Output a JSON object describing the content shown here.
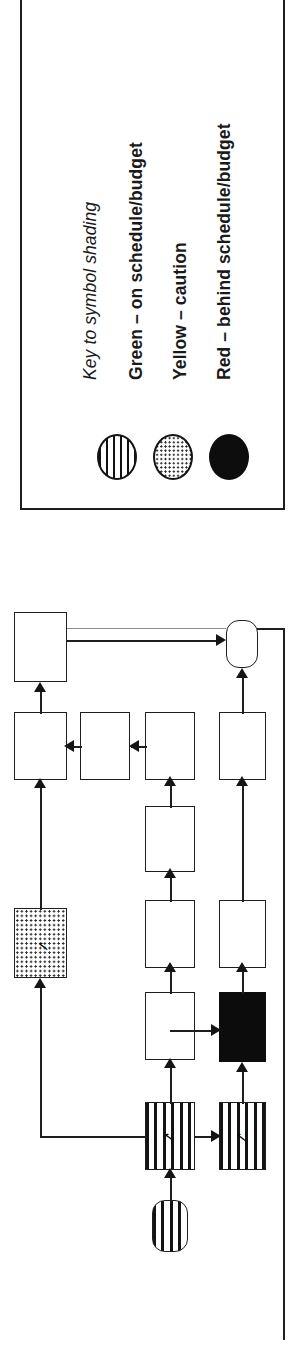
{
  "legend": {
    "title": "Key to symbol shading",
    "entries": [
      {
        "label": "Green – on schedule/budget",
        "swatch": "vertical-stripe-circle",
        "color": "#008000",
        "status": "on-schedule"
      },
      {
        "label": "Yellow – caution",
        "swatch": "stippled-circle",
        "color": "#FFD700",
        "status": "caution"
      },
      {
        "label": "Red – behind schedule/budget",
        "swatch": "solid-black-circle",
        "color": "#CC0000",
        "status": "behind-schedule"
      }
    ]
  },
  "flowchart": {
    "orientation": "rotated-90-ccw",
    "marker_glyph": "✓",
    "nodes": [
      {
        "id": "n-start",
        "label": "",
        "shape": "terminal",
        "shading": "green",
        "marker": ""
      },
      {
        "id": "n-a1",
        "label": "",
        "shape": "process",
        "shading": "green",
        "marker": "✓"
      },
      {
        "id": "n-a2",
        "label": "",
        "shape": "process",
        "shading": "green",
        "marker": "✓"
      },
      {
        "id": "n-red",
        "label": "",
        "shape": "process",
        "shading": "red",
        "marker": ""
      },
      {
        "id": "n-b1",
        "label": "",
        "shape": "process",
        "shading": "none",
        "marker": ""
      },
      {
        "id": "n-b2",
        "label": "",
        "shape": "process",
        "shading": "none",
        "marker": ""
      },
      {
        "id": "n-b3",
        "label": "",
        "shape": "process",
        "shading": "none",
        "marker": ""
      },
      {
        "id": "n-c1",
        "label": "",
        "shape": "process",
        "shading": "none",
        "marker": ""
      },
      {
        "id": "n-c2",
        "label": "",
        "shape": "process",
        "shading": "none",
        "marker": ""
      },
      {
        "id": "n-c3",
        "label": "",
        "shape": "process",
        "shading": "none",
        "marker": ""
      },
      {
        "id": "n-yellow",
        "label": "",
        "shape": "process",
        "shading": "yellow",
        "marker": "✓"
      },
      {
        "id": "n-top",
        "label": "",
        "shape": "process",
        "shading": "none",
        "marker": ""
      },
      {
        "id": "n-end",
        "label": "",
        "shape": "terminal",
        "shading": "none",
        "marker": ""
      }
    ],
    "edges": [
      {
        "from": "n-start",
        "to": "n-a1"
      },
      {
        "from": "n-a1",
        "to": "n-a2"
      },
      {
        "from": "n-a1",
        "to": "n-c1"
      },
      {
        "from": "n-a1",
        "to": "n-red"
      },
      {
        "from": "n-a1",
        "to": "n-yellow"
      },
      {
        "from": "n-a2",
        "to": "n-red"
      },
      {
        "from": "n-red",
        "to": "n-b1"
      },
      {
        "from": "n-b1",
        "to": "n-b2"
      },
      {
        "from": "n-b2",
        "to": "n-end"
      },
      {
        "from": "n-c1",
        "to": "n-c2"
      },
      {
        "from": "n-c2",
        "to": "n-c3"
      },
      {
        "from": "n-c3",
        "to": "n-mid"
      },
      {
        "from": "n-yellow",
        "to": "n-top"
      },
      {
        "from": "n-top",
        "to": "n-end"
      }
    ]
  }
}
